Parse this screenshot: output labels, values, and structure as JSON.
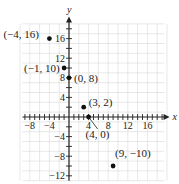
{
  "chart_data": {
    "type": "scatter",
    "title": "",
    "xlabel": "x",
    "ylabel": "y",
    "xlim": [
      -10,
      20
    ],
    "ylim": [
      -13,
      20
    ],
    "grid": true,
    "x_tick_labels": [
      "-8",
      "-4",
      "4",
      "8",
      "12",
      "16"
    ],
    "y_tick_labels": [
      "16",
      "12",
      "8",
      "4",
      "-4",
      "-8",
      "-12"
    ],
    "points": [
      {
        "x": -4,
        "y": 16,
        "label": "(−4, 16)"
      },
      {
        "x": -1,
        "y": 10,
        "label": "(−1, 10)"
      },
      {
        "x": 0,
        "y": 8,
        "label": "(0, 8)"
      },
      {
        "x": 3,
        "y": 2,
        "label": "(3, 2)"
      },
      {
        "x": 4,
        "y": 0,
        "label": "(4, 0)"
      },
      {
        "x": 9,
        "y": -10,
        "label": "(9, −10)"
      }
    ]
  },
  "style": {
    "grid_color": "#d9d9d9",
    "axis_color": "#222222",
    "point_color": "#111111"
  }
}
